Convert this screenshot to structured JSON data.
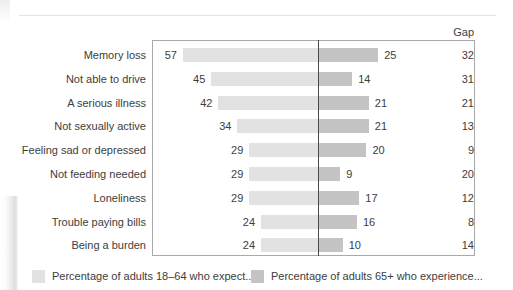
{
  "chart_data": {
    "type": "bar",
    "subtype": "diverging-butterfly",
    "title": "",
    "xlabel": "",
    "ylabel": "",
    "grid": false,
    "legend_position": "bottom",
    "axis_center_value": 0,
    "value_scale_px_per_unit": 2.37,
    "categories": [
      "Memory loss",
      "Not able to drive",
      "A serious illness",
      "Not sexually active",
      "Feeling sad or depressed",
      "Not feeding needed",
      "Loneliness",
      "Trouble paying bills",
      "Being a burden"
    ],
    "series": [
      {
        "name": "Percentage of adults 18–64 who expect...",
        "direction": "left",
        "color": "#e2e2e2",
        "values": [
          57,
          45,
          42,
          34,
          29,
          29,
          29,
          24,
          24
        ]
      },
      {
        "name": "Percentage of adults 65+ who experience...",
        "direction": "right",
        "color": "#c4c4c4",
        "values": [
          25,
          14,
          21,
          21,
          20,
          9,
          17,
          16,
          10
        ]
      }
    ],
    "gap_column": {
      "header": "Gap",
      "values": [
        32,
        31,
        21,
        13,
        9,
        20,
        12,
        8,
        14
      ]
    }
  },
  "legend": {
    "items": [
      {
        "label": "Percentage of adults 18–64 who expect...",
        "color": "#e2e2e2",
        "swatch_name": "legend-swatch-expect"
      },
      {
        "label": "Percentage of adults 65+ who experience...",
        "color": "#c4c4c4",
        "swatch_name": "legend-swatch-experience"
      }
    ]
  },
  "colors": {
    "bar_left": "#e2e2e2",
    "bar_right": "#c4c4c4",
    "text": "#3d3d3d",
    "frame": "#a9a9a9",
    "center_line": "#4a4a4a",
    "background": "#ffffff"
  }
}
